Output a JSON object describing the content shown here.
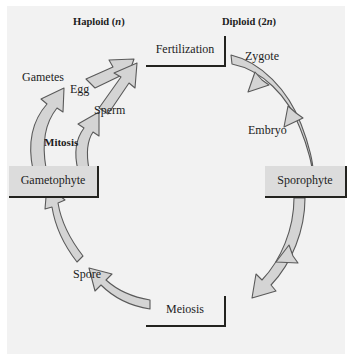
{
  "diagram": {
    "type": "cycle-diagram",
    "background_color": "#f2f2f2",
    "arrow_fill": "#d4d4d4",
    "arrow_stroke": "#5a5a5a",
    "box_fill": "#dcdcdc",
    "box_border": "#23231f",
    "text_color": "#1c1c1c"
  },
  "headers": {
    "left": {
      "text": "Haploid (",
      "italic": "n",
      "tail": ")"
    },
    "right": {
      "text": "Diploid (2",
      "italic": "n",
      "tail": ")"
    }
  },
  "stages": {
    "fertilization": "Fertilization",
    "zygote": "Zygote",
    "embryo": "Embryo",
    "sporophyte": "Sporophyte",
    "meiosis": "Meiosis",
    "spore": "Spore",
    "gametophyte": "Gametophyte",
    "mitosis": "Mitosis",
    "gametes": "Gametes",
    "egg": "Egg",
    "sperm": "Sperm"
  },
  "flow": [
    {
      "from": "Gametophyte",
      "to": "Egg",
      "via": "Mitosis"
    },
    {
      "from": "Gametophyte",
      "to": "Sperm",
      "via": "Mitosis"
    },
    {
      "from": "Egg",
      "to": "Fertilization"
    },
    {
      "from": "Sperm",
      "to": "Fertilization"
    },
    {
      "from": "Fertilization",
      "to": "Sporophyte",
      "via": "Zygote, Embryo"
    },
    {
      "from": "Sporophyte",
      "to": "Meiosis"
    },
    {
      "from": "Meiosis",
      "to": "Spore"
    },
    {
      "from": "Spore",
      "to": "Gametophyte"
    }
  ]
}
